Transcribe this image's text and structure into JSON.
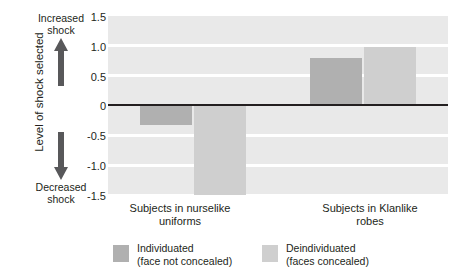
{
  "title_partial": "",
  "axis": {
    "ylabel": "Level of shock selected",
    "increased_line1": "Increased",
    "increased_line2": "shock",
    "decreased_line1": "Decreased",
    "decreased_line2": "shock",
    "ticks": [
      "1.5",
      "1.0",
      "0.5",
      "0",
      "-0.5",
      "-1.0",
      "-1.5"
    ],
    "tick_values": [
      1.5,
      1.0,
      0.5,
      0,
      -0.5,
      -1.0,
      -1.5
    ]
  },
  "colors": {
    "dark_bar": "#b0b0b0",
    "light_bar": "#cfcfcf",
    "plot_background": "#e9e9e9",
    "gridline": "#ffffff",
    "zeroline": "#231f20",
    "text": "#231f20"
  },
  "categories_display": [
    {
      "line1": "Subjects in nurselike",
      "line2": "uniforms"
    },
    {
      "line1": "Subjects in Klanlike",
      "line2": "robes"
    }
  ],
  "legend": [
    {
      "line1": "Individuated",
      "line2": "(face not concealed)",
      "swatch": "#b0b0b0"
    },
    {
      "line1": "Deindividuated",
      "line2": "(faces concealed)",
      "swatch": "#cfcfcf"
    }
  ],
  "chart_data": {
    "type": "bar",
    "title": "",
    "xlabel": "",
    "ylabel": "Level of shock selected",
    "categories": [
      "Subjects in nurselike uniforms",
      "Subjects in Klanlike robes"
    ],
    "series": [
      {
        "name": "Individuated (face not concealed)",
        "values": [
          -0.35,
          0.78
        ],
        "color": "#b0b0b0"
      },
      {
        "name": "Deindividuated (faces concealed)",
        "values": [
          -1.55,
          0.97
        ],
        "color": "#cfcfcf"
      }
    ],
    "ylim": [
      -1.5,
      1.5
    ],
    "yticks": [
      1.5,
      1.0,
      0.5,
      0,
      -0.5,
      -1.0,
      -1.5
    ],
    "grid": true,
    "grid_orientation": "horizontal",
    "legend_position": "bottom",
    "zero_line": true,
    "annotations": [
      "Increased shock (upward arrow at top of y-axis)",
      "Decreased shock (downward arrow at bottom of y-axis)"
    ]
  }
}
